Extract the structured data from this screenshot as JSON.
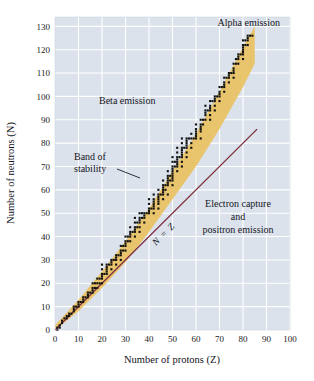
{
  "figure": {
    "background": "#ffffff",
    "plot_background": "#dbe2eb",
    "grid_color": "#ffffff",
    "band_color": "#e9c266",
    "point_color": "#111111",
    "nz_line_color": "#7c2b3d",
    "leader_color": "#1b1b28"
  },
  "chart_data": {
    "type": "scatter",
    "title": "",
    "xlabel": "Number of protons (Z)",
    "ylabel": "Number of neutrons (N)",
    "xlim": [
      0,
      100
    ],
    "ylim": [
      0,
      134
    ],
    "grid": true,
    "legend": "none",
    "xticks": [
      0,
      10,
      20,
      30,
      40,
      50,
      60,
      70,
      80,
      90,
      100
    ],
    "yticks": [
      10,
      20,
      30,
      40,
      50,
      60,
      70,
      80,
      90,
      100,
      110,
      120,
      130
    ],
    "xtick_labels": [
      "0",
      "10",
      "20",
      "30",
      "40",
      "50",
      "60",
      "70",
      "80",
      "90",
      "100"
    ],
    "ytick_labels": [
      "10",
      "20",
      "30",
      "40",
      "50",
      "60",
      "70",
      "80",
      "90",
      "100",
      "110",
      "120",
      "130"
    ],
    "annotations": [
      {
        "id": "alpha-emission",
        "text": "Alpha emission",
        "x": 74,
        "y": 131
      },
      {
        "id": "beta-emission",
        "text": "Beta emission",
        "x": 30,
        "y": 97
      },
      {
        "id": "band-of-stability",
        "text": "Band of stability",
        "x": 18,
        "y": 72
      },
      {
        "id": "electron-capture",
        "text": "Electron capture and positron emission",
        "x": 66,
        "y": 50
      },
      {
        "id": "n-equals-z",
        "text": "N = Z",
        "x": 47,
        "y": 40,
        "rotation": -45
      }
    ],
    "annotation_lines": {
      "electron_capture_line1": "Electron capture",
      "electron_capture_line2": "and",
      "electron_capture_line3": "positron emission",
      "band_line1": "Band of",
      "band_line2": "stability",
      "nz_n": "N",
      "nz_eq": "=",
      "nz_z": "Z"
    },
    "reference_line": {
      "name": "N = Z",
      "x": [
        0,
        86
      ],
      "y": [
        0,
        86
      ],
      "color": "#7c2b3d"
    },
    "band_of_stability": {
      "description": "Shaded region of stable nuclides, widening above N = Z as Z increases",
      "lower_edge": [
        [
          0,
          0
        ],
        [
          10,
          8
        ],
        [
          20,
          18
        ],
        [
          30,
          29
        ],
        [
          40,
          42
        ],
        [
          50,
          56
        ],
        [
          60,
          70
        ],
        [
          70,
          86
        ],
        [
          80,
          104
        ],
        [
          85,
          114
        ]
      ],
      "upper_edge": [
        [
          0,
          2
        ],
        [
          10,
          13
        ],
        [
          20,
          25
        ],
        [
          30,
          38
        ],
        [
          40,
          52
        ],
        [
          50,
          68
        ],
        [
          60,
          84
        ],
        [
          70,
          102
        ],
        [
          80,
          121
        ],
        [
          85,
          130
        ]
      ]
    },
    "series": [
      {
        "name": "Stable nuclides",
        "marker": "square",
        "color": "#111111",
        "points": [
          [
            1,
            0
          ],
          [
            1,
            1
          ],
          [
            2,
            1
          ],
          [
            2,
            2
          ],
          [
            3,
            3
          ],
          [
            3,
            4
          ],
          [
            4,
            5
          ],
          [
            5,
            5
          ],
          [
            5,
            6
          ],
          [
            6,
            6
          ],
          [
            6,
            7
          ],
          [
            7,
            7
          ],
          [
            8,
            8
          ],
          [
            8,
            9
          ],
          [
            8,
            10
          ],
          [
            9,
            10
          ],
          [
            10,
            10
          ],
          [
            10,
            11
          ],
          [
            10,
            12
          ],
          [
            11,
            12
          ],
          [
            12,
            12
          ],
          [
            12,
            13
          ],
          [
            12,
            14
          ],
          [
            13,
            14
          ],
          [
            14,
            14
          ],
          [
            14,
            15
          ],
          [
            14,
            16
          ],
          [
            15,
            16
          ],
          [
            16,
            16
          ],
          [
            16,
            17
          ],
          [
            16,
            18
          ],
          [
            16,
            20
          ],
          [
            17,
            18
          ],
          [
            17,
            20
          ],
          [
            18,
            18
          ],
          [
            18,
            20
          ],
          [
            18,
            22
          ],
          [
            19,
            20
          ],
          [
            19,
            22
          ],
          [
            20,
            20
          ],
          [
            20,
            22
          ],
          [
            20,
            23
          ],
          [
            20,
            24
          ],
          [
            20,
            26
          ],
          [
            20,
            28
          ],
          [
            21,
            24
          ],
          [
            22,
            24
          ],
          [
            22,
            25
          ],
          [
            22,
            26
          ],
          [
            22,
            27
          ],
          [
            22,
            28
          ],
          [
            23,
            28
          ],
          [
            24,
            26
          ],
          [
            24,
            28
          ],
          [
            24,
            29
          ],
          [
            24,
            30
          ],
          [
            25,
            30
          ],
          [
            26,
            28
          ],
          [
            26,
            30
          ],
          [
            26,
            31
          ],
          [
            26,
            32
          ],
          [
            27,
            32
          ],
          [
            28,
            30
          ],
          [
            28,
            32
          ],
          [
            28,
            33
          ],
          [
            28,
            34
          ],
          [
            28,
            36
          ],
          [
            29,
            34
          ],
          [
            29,
            36
          ],
          [
            30,
            34
          ],
          [
            30,
            36
          ],
          [
            30,
            37
          ],
          [
            30,
            38
          ],
          [
            30,
            40
          ],
          [
            31,
            38
          ],
          [
            31,
            40
          ],
          [
            32,
            38
          ],
          [
            32,
            40
          ],
          [
            32,
            41
          ],
          [
            32,
            42
          ],
          [
            32,
            44
          ],
          [
            33,
            42
          ],
          [
            34,
            40
          ],
          [
            34,
            42
          ],
          [
            34,
            43
          ],
          [
            34,
            44
          ],
          [
            34,
            46
          ],
          [
            34,
            48
          ],
          [
            35,
            44
          ],
          [
            35,
            46
          ],
          [
            36,
            42
          ],
          [
            36,
            44
          ],
          [
            36,
            46
          ],
          [
            36,
            47
          ],
          [
            36,
            48
          ],
          [
            36,
            50
          ],
          [
            37,
            48
          ],
          [
            37,
            50
          ],
          [
            38,
            46
          ],
          [
            38,
            48
          ],
          [
            38,
            49
          ],
          [
            38,
            50
          ],
          [
            39,
            50
          ],
          [
            40,
            50
          ],
          [
            40,
            51
          ],
          [
            40,
            52
          ],
          [
            40,
            54
          ],
          [
            40,
            56
          ],
          [
            41,
            52
          ],
          [
            42,
            50
          ],
          [
            42,
            52
          ],
          [
            42,
            53
          ],
          [
            42,
            54
          ],
          [
            42,
            55
          ],
          [
            42,
            56
          ],
          [
            42,
            58
          ],
          [
            44,
            52
          ],
          [
            44,
            54
          ],
          [
            44,
            55
          ],
          [
            44,
            56
          ],
          [
            44,
            57
          ],
          [
            44,
            58
          ],
          [
            44,
            60
          ],
          [
            45,
            58
          ],
          [
            46,
            56
          ],
          [
            46,
            58
          ],
          [
            46,
            59
          ],
          [
            46,
            60
          ],
          [
            46,
            61
          ],
          [
            46,
            62
          ],
          [
            46,
            64
          ],
          [
            47,
            60
          ],
          [
            47,
            62
          ],
          [
            48,
            58
          ],
          [
            48,
            62
          ],
          [
            48,
            63
          ],
          [
            48,
            64
          ],
          [
            48,
            65
          ],
          [
            48,
            66
          ],
          [
            48,
            68
          ],
          [
            49,
            64
          ],
          [
            49,
            66
          ],
          [
            50,
            62
          ],
          [
            50,
            64
          ],
          [
            50,
            65
          ],
          [
            50,
            66
          ],
          [
            50,
            67
          ],
          [
            50,
            68
          ],
          [
            50,
            69
          ],
          [
            50,
            70
          ],
          [
            50,
            72
          ],
          [
            50,
            74
          ],
          [
            51,
            70
          ],
          [
            51,
            72
          ],
          [
            52,
            68
          ],
          [
            52,
            70
          ],
          [
            52,
            71
          ],
          [
            52,
            72
          ],
          [
            52,
            73
          ],
          [
            52,
            74
          ],
          [
            52,
            76
          ],
          [
            52,
            78
          ],
          [
            53,
            74
          ],
          [
            54,
            70
          ],
          [
            54,
            72
          ],
          [
            54,
            74
          ],
          [
            54,
            75
          ],
          [
            54,
            76
          ],
          [
            54,
            77
          ],
          [
            54,
            78
          ],
          [
            54,
            80
          ],
          [
            54,
            82
          ],
          [
            55,
            78
          ],
          [
            56,
            74
          ],
          [
            56,
            76
          ],
          [
            56,
            78
          ],
          [
            56,
            79
          ],
          [
            56,
            80
          ],
          [
            56,
            81
          ],
          [
            56,
            82
          ],
          [
            57,
            82
          ],
          [
            58,
            78
          ],
          [
            58,
            80
          ],
          [
            58,
            82
          ],
          [
            58,
            84
          ],
          [
            59,
            82
          ],
          [
            60,
            82
          ],
          [
            60,
            83
          ],
          [
            60,
            84
          ],
          [
            60,
            85
          ],
          [
            60,
            86
          ],
          [
            60,
            88
          ],
          [
            62,
            82
          ],
          [
            62,
            85
          ],
          [
            62,
            86
          ],
          [
            62,
            87
          ],
          [
            62,
            88
          ],
          [
            62,
            90
          ],
          [
            63,
            88
          ],
          [
            63,
            90
          ],
          [
            64,
            90
          ],
          [
            64,
            92
          ],
          [
            64,
            93
          ],
          [
            64,
            94
          ],
          [
            64,
            96
          ],
          [
            65,
            94
          ],
          [
            66,
            90
          ],
          [
            66,
            92
          ],
          [
            66,
            94
          ],
          [
            66,
            95
          ],
          [
            66,
            96
          ],
          [
            66,
            98
          ],
          [
            67,
            98
          ],
          [
            68,
            94
          ],
          [
            68,
            96
          ],
          [
            68,
            98
          ],
          [
            68,
            99
          ],
          [
            68,
            100
          ],
          [
            69,
            100
          ],
          [
            70,
            98
          ],
          [
            70,
            100
          ],
          [
            70,
            101
          ],
          [
            70,
            102
          ],
          [
            70,
            104
          ],
          [
            71,
            104
          ],
          [
            72,
            102
          ],
          [
            72,
            104
          ],
          [
            72,
            105
          ],
          [
            72,
            106
          ],
          [
            72,
            108
          ],
          [
            73,
            108
          ],
          [
            74,
            106
          ],
          [
            74,
            108
          ],
          [
            74,
            109
          ],
          [
            74,
            110
          ],
          [
            75,
            110
          ],
          [
            76,
            108
          ],
          [
            76,
            110
          ],
          [
            76,
            111
          ],
          [
            76,
            112
          ],
          [
            76,
            114
          ],
          [
            77,
            114
          ],
          [
            77,
            116
          ],
          [
            78,
            114
          ],
          [
            78,
            116
          ],
          [
            78,
            117
          ],
          [
            78,
            118
          ],
          [
            79,
            118
          ],
          [
            80,
            116
          ],
          [
            80,
            118
          ],
          [
            80,
            119
          ],
          [
            80,
            120
          ],
          [
            80,
            121
          ],
          [
            80,
            122
          ],
          [
            80,
            124
          ],
          [
            81,
            122
          ],
          [
            81,
            124
          ],
          [
            82,
            122
          ],
          [
            82,
            124
          ],
          [
            82,
            125
          ],
          [
            82,
            126
          ],
          [
            83,
            126
          ],
          [
            84,
            126
          ]
        ]
      }
    ]
  }
}
